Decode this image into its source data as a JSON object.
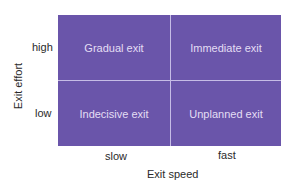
{
  "diagram": {
    "type": "2x2 matrix",
    "x_axis": {
      "label": "Exit speed",
      "ticks": [
        "slow",
        "fast"
      ]
    },
    "y_axis": {
      "label": "Exit effort",
      "ticks": [
        "high",
        "low"
      ]
    },
    "cells": {
      "top_left": "Gradual exit",
      "top_right": "Immediate exit",
      "bottom_left": "Indecisive exit",
      "bottom_right": "Unplanned exit"
    },
    "colors": {
      "fill": "#6a55aa",
      "divider": "#c6bce6",
      "cell_text": "#e4def4"
    }
  }
}
